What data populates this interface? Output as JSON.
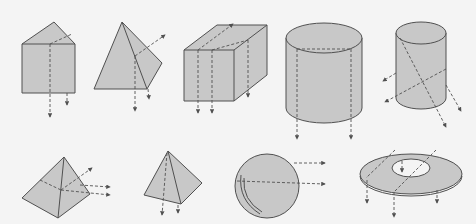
{
  "figure": {
    "colors": {
      "background": "#f4f4f4",
      "solid_fill": "#c8c8c8",
      "stroke": "#505050"
    },
    "rows": [
      {
        "row": "top",
        "shapes": [
          {
            "id": "triangular-prism",
            "label": "triangular prism",
            "dashed_arrows": 2
          },
          {
            "id": "triangular-pyramid",
            "label": "triangular pyramid",
            "dashed_arrows": 3
          },
          {
            "id": "rectangular-prism",
            "label": "rectangular prism",
            "dashed_arrows": 4
          },
          {
            "id": "cylinder-wide",
            "label": "cylinder",
            "dashed_arrows": 2
          },
          {
            "id": "cylinder-narrow",
            "label": "cylinder (oblique cuts)",
            "dashed_arrows": 4
          }
        ]
      },
      {
        "row": "bottom",
        "shapes": [
          {
            "id": "square-pyramid-tilted",
            "label": "square pyramid",
            "dashed_arrows": 3
          },
          {
            "id": "square-pyramid",
            "label": "square pyramid",
            "dashed_arrows": 2
          },
          {
            "id": "sphere",
            "label": "sphere",
            "dashed_arrows": 2
          },
          {
            "id": "annulus-disk",
            "label": "ring / washer",
            "dashed_arrows": 4
          }
        ]
      }
    ]
  }
}
